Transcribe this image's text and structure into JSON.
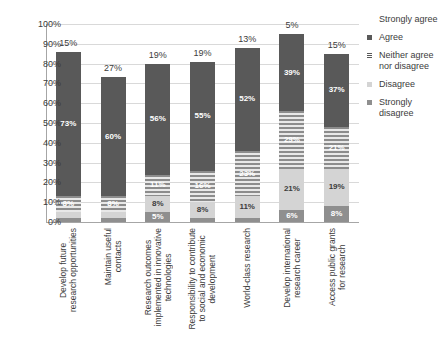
{
  "chart_data": {
    "type": "bar",
    "subtype": "stacked-percentage",
    "title": "",
    "xlabel": "",
    "ylabel": "",
    "ylim": [
      0,
      100
    ],
    "ytick_labels": [
      "0%",
      "10%",
      "20%",
      "30%",
      "40%",
      "50%",
      "60%",
      "70%",
      "80%",
      "90%",
      "100%"
    ],
    "ytick_values": [
      0,
      10,
      20,
      30,
      40,
      50,
      60,
      70,
      80,
      90,
      100
    ],
    "grid": true,
    "legend_position": "right",
    "categories": [
      "Develop future research opportunities",
      "Maintain useful contacts",
      "Research outcomes implemented in innovative technologies",
      "Responsibility to contribute to social and economic development",
      "World-class research",
      "Develop international research career",
      "Access public grants for research"
    ],
    "series": [
      {
        "name": "Strongly disagree",
        "values": [
          2,
          2,
          5,
          2,
          2,
          6,
          8
        ]
      },
      {
        "name": "Disagree",
        "values": [
          3,
          3,
          8,
          8,
          11,
          21,
          19
        ]
      },
      {
        "name": "Neither agree nor disagree",
        "values": [
          8,
          8,
          11,
          16,
          23,
          29,
          21
        ]
      },
      {
        "name": "Agree",
        "values": [
          73,
          60,
          56,
          55,
          52,
          39,
          37
        ]
      },
      {
        "name": "Strongly agree",
        "values": [
          15,
          27,
          19,
          19,
          13,
          5,
          15
        ]
      }
    ],
    "legend_entries": [
      "Strongly agree",
      "Agree",
      "Neither agree nor disagree",
      "Disagree",
      "Strongly disagree"
    ],
    "colors": {
      "strongly_agree": "#ffffff",
      "agree": "#595959",
      "neither": "#8c8c8c",
      "disagree": "#d4d4d4",
      "strongly_disagree": "#8f8f8f",
      "grid": "#d9d9d9",
      "axis": "#a6a6a6",
      "text": "#3c3c3c"
    },
    "top_labels": [
      "15%",
      "27%",
      "19%",
      "19%",
      "13%",
      "5%",
      "15%"
    ],
    "bars": [
      {
        "category": "Develop future research opportunities",
        "category_display": "Develop future\nresearch opportunities",
        "segments": [
          {
            "key": "strongly_disagree",
            "label": "2%",
            "value": 2
          },
          {
            "key": "disagree",
            "label": "3%",
            "value": 3
          },
          {
            "key": "neither",
            "label": "8%",
            "value": 8
          },
          {
            "key": "agree",
            "label": "73%",
            "value": 73
          },
          {
            "key": "strongly_agree",
            "label": "15%",
            "value": 15
          }
        ]
      },
      {
        "category": "Maintain useful contacts",
        "category_display": "Maintain useful\ncontacts",
        "segments": [
          {
            "key": "strongly_disagree",
            "label": "2%",
            "value": 2
          },
          {
            "key": "disagree",
            "label": "3%",
            "value": 3
          },
          {
            "key": "neither",
            "label": "8%",
            "value": 8
          },
          {
            "key": "agree",
            "label": "60%",
            "value": 60
          },
          {
            "key": "strongly_agree",
            "label": "27%",
            "value": 27
          }
        ]
      },
      {
        "category": "Research outcomes implemented in innovative technologies",
        "category_display": "Research outcomes\nimplemented in innovative\ntechnologies",
        "segments": [
          {
            "key": "strongly_disagree",
            "label": "5%",
            "value": 5
          },
          {
            "key": "disagree",
            "label": "8%",
            "value": 8
          },
          {
            "key": "neither",
            "label": "11%",
            "value": 11
          },
          {
            "key": "agree",
            "label": "56%",
            "value": 56
          },
          {
            "key": "strongly_agree",
            "label": "19%",
            "value": 19
          }
        ]
      },
      {
        "category": "Responsibility to contribute to social and economic development",
        "category_display": "Responsibility to contribute\nto social and economic\ndevelopment",
        "segments": [
          {
            "key": "strongly_disagree",
            "label": "2%",
            "value": 2
          },
          {
            "key": "disagree",
            "label": "8%",
            "value": 8
          },
          {
            "key": "neither",
            "label": "16%",
            "value": 16
          },
          {
            "key": "agree",
            "label": "55%",
            "value": 55
          },
          {
            "key": "strongly_agree",
            "label": "19%",
            "value": 19
          }
        ]
      },
      {
        "category": "World-class research",
        "category_display": "World-class research",
        "segments": [
          {
            "key": "strongly_disagree",
            "label": "2%",
            "value": 2
          },
          {
            "key": "disagree",
            "label": "11%",
            "value": 11
          },
          {
            "key": "neither",
            "label": "23%",
            "value": 23
          },
          {
            "key": "agree",
            "label": "52%",
            "value": 52
          },
          {
            "key": "strongly_agree",
            "label": "13%",
            "value": 13
          }
        ]
      },
      {
        "category": "Develop international research career",
        "category_display": "Develop international\nresearch career",
        "segments": [
          {
            "key": "strongly_disagree",
            "label": "6%",
            "value": 6
          },
          {
            "key": "disagree",
            "label": "21%",
            "value": 21
          },
          {
            "key": "neither",
            "label": "29%",
            "value": 29
          },
          {
            "key": "agree",
            "label": "39%",
            "value": 39
          },
          {
            "key": "strongly_agree",
            "label": "5%",
            "value": 5
          }
        ]
      },
      {
        "category": "Access public grants for research",
        "category_display": "Access public grants\nfor research",
        "segments": [
          {
            "key": "strongly_disagree",
            "label": "8%",
            "value": 8
          },
          {
            "key": "disagree",
            "label": "19%",
            "value": 19
          },
          {
            "key": "neither",
            "label": "21%",
            "value": 21
          },
          {
            "key": "agree",
            "label": "37%",
            "value": 37
          },
          {
            "key": "strongly_agree",
            "label": "15%",
            "value": 15
          }
        ]
      }
    ]
  }
}
